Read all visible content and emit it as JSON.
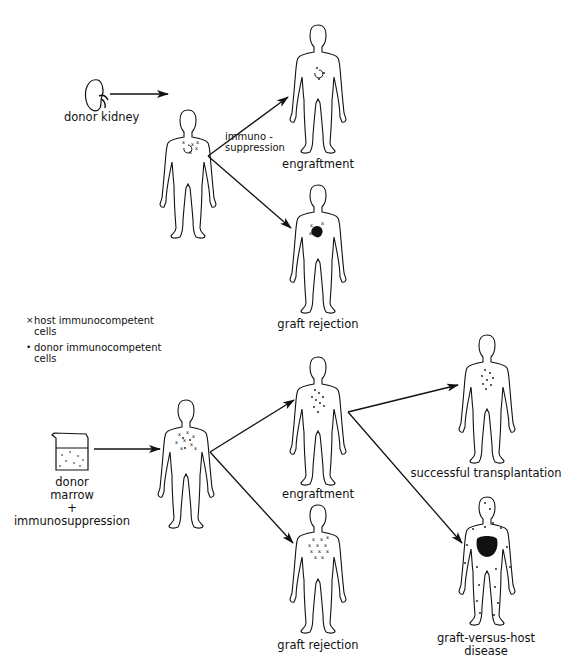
{
  "kidney_section": {
    "donor_label": "donor kidney",
    "arrow_label": [
      "immuno -",
      "suppression"
    ],
    "outcomes": [
      {
        "label": "engraftment"
      },
      {
        "label": "graft rejection"
      }
    ]
  },
  "legend": {
    "items": [
      {
        "symbol": "×",
        "text_line1": "host immunocompetent",
        "text_line2": "cells"
      },
      {
        "symbol": "•",
        "text_line1": "donor immunocompetent",
        "text_line2": "cells"
      }
    ]
  },
  "marrow_section": {
    "donor_label": [
      "donor",
      "marrow",
      "+",
      "immunosuppression"
    ],
    "outcomes": [
      {
        "label": "engraftment"
      },
      {
        "label": "graft rejection"
      }
    ],
    "engraftment_outcomes": [
      {
        "label": "successful transplantation"
      },
      {
        "label_line1": "graft-versus-host",
        "label_line2": "disease"
      }
    ]
  },
  "colors": {
    "ink": "#111111",
    "background": "#ffffff"
  }
}
